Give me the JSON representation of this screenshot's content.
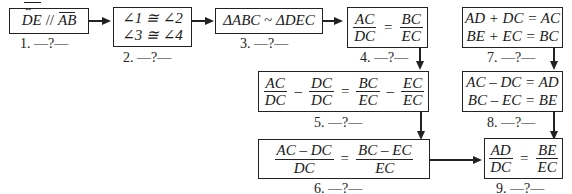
{
  "steps": [
    {
      "id": 1,
      "statement": "DE // AB",
      "parts": {
        "left": "DE",
        "rel": "//",
        "right": "AB"
      },
      "label": "1.  —?—"
    },
    {
      "id": 2,
      "lines": [
        "∠1 ≅ ∠2",
        "∠3 ≅ ∠4"
      ],
      "label": "2.  —?—"
    },
    {
      "id": 3,
      "statement": "ΔABC ~ ΔDEC",
      "label": "3.  —?—"
    },
    {
      "id": 4,
      "frac_left": {
        "num": "AC",
        "den": "DC"
      },
      "rel": "=",
      "frac_right": {
        "num": "BC",
        "den": "EC"
      },
      "label": "4.  —?—"
    },
    {
      "id": 5,
      "terms": [
        {
          "num": "AC",
          "den": "DC"
        },
        {
          "num": "DC",
          "den": "DC"
        },
        {
          "num": "BC",
          "den": "EC"
        },
        {
          "num": "EC",
          "den": "EC"
        }
      ],
      "ops": [
        "–",
        "=",
        "–"
      ],
      "label": "5.  —?—"
    },
    {
      "id": 6,
      "frac_left": {
        "num": "AC – DC",
        "den": "DC"
      },
      "rel": "=",
      "frac_right": {
        "num": "BC – EC",
        "den": "EC"
      },
      "label": "6.  —?—"
    },
    {
      "id": 7,
      "lines": [
        "AD + DC = AC",
        "BE + EC = BC"
      ],
      "label": "7.  —?—"
    },
    {
      "id": 8,
      "lines": [
        "AC – DC = AD",
        "BC – EC = BE"
      ],
      "label": "8.  —?—"
    },
    {
      "id": 9,
      "frac_left": {
        "num": "AD",
        "den": "DC"
      },
      "rel": "=",
      "frac_right": {
        "num": "BE",
        "den": "EC"
      },
      "label": "9.  —?—"
    }
  ]
}
